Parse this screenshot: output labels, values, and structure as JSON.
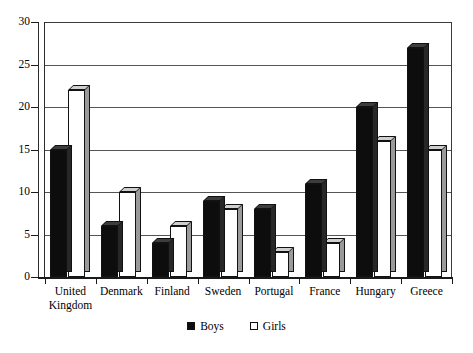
{
  "chart_data": {
    "type": "bar",
    "title": "",
    "xlabel": "",
    "ylabel": "",
    "ylim": [
      0,
      30
    ],
    "yticks": [
      0,
      5,
      10,
      15,
      20,
      25,
      30
    ],
    "grid": true,
    "legend_position": "bottom-center",
    "categories": [
      "United Kingdom",
      "Denmark",
      "Finland",
      "Sweden",
      "Portugal",
      "France",
      "Hungary",
      "Greece"
    ],
    "series": [
      {
        "name": "Boys",
        "color": "#0d0d0d",
        "values": [
          15,
          6,
          4,
          9,
          8,
          11,
          20,
          27
        ]
      },
      {
        "name": "Girls",
        "color": "#ffffff",
        "values": [
          22,
          10,
          6,
          8,
          3,
          4,
          16,
          15
        ]
      }
    ]
  },
  "legend": {
    "items": [
      {
        "label": "Boys",
        "style": "filled"
      },
      {
        "label": "Girls",
        "style": "outlined"
      }
    ]
  },
  "axis": {
    "y_tick_labels": [
      "0",
      "5",
      "10",
      "15",
      "20",
      "25",
      "30"
    ],
    "category_labels": [
      [
        "United",
        "Kingdom"
      ],
      [
        "Denmark"
      ],
      [
        "Finland"
      ],
      [
        "Sweden"
      ],
      [
        "Portugal"
      ],
      [
        "France"
      ],
      [
        "Hungary"
      ],
      [
        "Greece"
      ]
    ]
  }
}
